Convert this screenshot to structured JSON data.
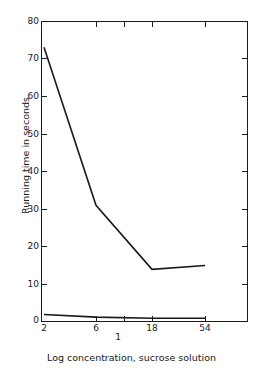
{
  "chart_data": {
    "type": "line",
    "title": "",
    "xlabel": "Log concentration, sucrose solution",
    "ylabel": "Running time in seconds",
    "x": [
      2,
      6,
      18,
      54
    ],
    "x_tick_labels": [
      "2",
      "6",
      "18",
      "54"
    ],
    "x_extra_label": "1",
    "y_tick_labels": [
      "0",
      "10",
      "20",
      "30",
      "40",
      "50",
      "60",
      "70",
      "80"
    ],
    "y_ticks": [
      0,
      10,
      20,
      30,
      40,
      50,
      60,
      70,
      80
    ],
    "ylim": [
      0,
      80
    ],
    "grid": false,
    "legend": "none",
    "line_color": "#1a1a1a",
    "series": [
      {
        "name": "upper-curve",
        "values": [
          73,
          31,
          14,
          15
        ]
      },
      {
        "name": "lower-curve",
        "values": [
          2,
          1.3,
          1,
          1
        ]
      }
    ]
  },
  "axis": {
    "y_title": "Running time in seconds",
    "x_title": "Log concentration, sucrose solution",
    "y_labels": [
      "80",
      "70",
      "60",
      "50",
      "40",
      "30",
      "20",
      "10",
      "0"
    ],
    "x_labels": [
      "2",
      "6",
      "18",
      "54"
    ],
    "x_stray_label": "1"
  }
}
